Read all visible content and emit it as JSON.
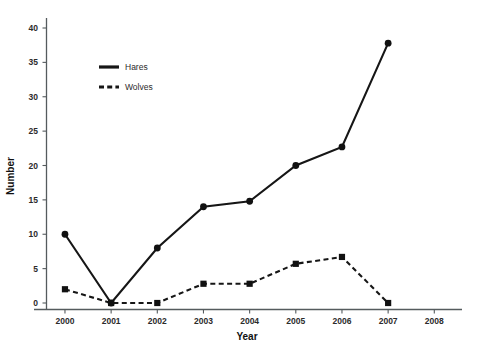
{
  "chart_data": {
    "type": "line",
    "title": "",
    "subtitle": "",
    "xlabel": "Year",
    "ylabel": "Number",
    "categories": [
      "2000",
      "2001",
      "2002",
      "2003",
      "2004",
      "2005",
      "2006",
      "2007",
      "2008"
    ],
    "x": [
      2000,
      2001,
      2002,
      2003,
      2004,
      2005,
      2006,
      2007,
      2008
    ],
    "xlim": [
      1999.6,
      2008.6
    ],
    "ylim": [
      0,
      41.5
    ],
    "yticks": [
      0,
      5,
      10,
      15,
      20,
      25,
      30,
      35,
      40
    ],
    "ytick_labels": [
      "0",
      "5",
      "10",
      "15",
      "20",
      "25",
      "30",
      "35",
      "40"
    ],
    "xticks": [
      2000,
      2001,
      2002,
      2003,
      2004,
      2005,
      2006,
      2007,
      2008
    ],
    "xtick_labels": [
      "2000",
      "2001",
      "2002",
      "2003",
      "2004",
      "2005",
      "2006",
      "2007",
      "2008"
    ],
    "grid": false,
    "legend_position": "upper-left-inside",
    "series": [
      {
        "name": "Hares",
        "linestyle": "solid",
        "marker": "circle",
        "color": "#161616",
        "x": [
          2000,
          2001,
          2002,
          2003,
          2004,
          2005,
          2006,
          2007
        ],
        "values": [
          10,
          0,
          8,
          14,
          14.8,
          20,
          22.7,
          37.8
        ]
      },
      {
        "name": "Wolves",
        "linestyle": "dashed",
        "marker": "square",
        "color": "#161616",
        "x": [
          2000,
          2001,
          2002,
          2003,
          2004,
          2005,
          2006,
          2007
        ],
        "values": [
          2,
          0,
          0,
          2.8,
          2.8,
          5.7,
          6.7,
          0
        ]
      }
    ],
    "legend": [
      {
        "label": "Hares",
        "linestyle": "solid"
      },
      {
        "label": "Wolves",
        "linestyle": "dashed"
      }
    ]
  }
}
